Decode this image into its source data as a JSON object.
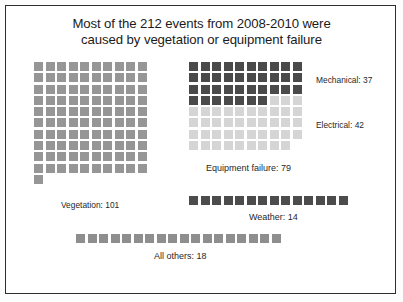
{
  "chart_data": {
    "type": "bar",
    "subtype": "waffle",
    "title": "Most of the 212 events from 2008-2010 were caused by vegetation or equipment failure",
    "title_lines": [
      "Most of the 212 events from 2008-2010 were",
      "caused by vegetation or equipment failure"
    ],
    "total_events": 212,
    "period": "2008-2010",
    "unit": "1 square = 1 event",
    "xlabel": "",
    "ylabel": "",
    "grid": false,
    "legend_position": "inline-right",
    "categories": [
      "Vegetation",
      "Mechanical",
      "Electrical",
      "Weather",
      "All others"
    ],
    "values": [
      101,
      37,
      42,
      14,
      18
    ],
    "groups": [
      {
        "name": "Vegetation",
        "label": "Vegetation: 101",
        "value": 101,
        "color": "#969696",
        "columns": 10
      },
      {
        "name": "Equipment failure",
        "label": "Equipment failure: 79",
        "value": 79,
        "columns": 10,
        "segments": [
          {
            "name": "Mechanical",
            "label": "Mechanical: 37",
            "value": 37,
            "color": "#4a4a4a"
          },
          {
            "name": "Electrical",
            "label": "Electrical: 42",
            "value": 42,
            "color": "#d5d5d5"
          }
        ]
      },
      {
        "name": "Weather",
        "label": "Weather: 14",
        "value": 14,
        "color": "#4c4c4c",
        "columns": 14
      },
      {
        "name": "All others",
        "label": "All others: 18",
        "value": 18,
        "color": "#8e8e8e",
        "columns": 18
      }
    ]
  },
  "labels": {
    "vegetation": "Vegetation: 101",
    "equipment_failure": "Equipment failure: 79",
    "mechanical": "Mechanical: 37",
    "electrical": "Electrical: 42",
    "weather": "Weather: 14",
    "all_others": "All others: 18"
  },
  "colors": {
    "vegetation": "#969696",
    "mechanical": "#4a4a4a",
    "electrical": "#d5d5d5",
    "weather": "#4c4c4c",
    "all_others": "#8e8e8e",
    "border": "#2e2e2e",
    "background": "#ffffff",
    "text": "#1b1b1b"
  }
}
